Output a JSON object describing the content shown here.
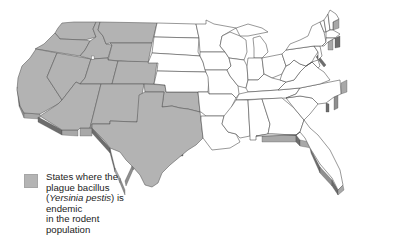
{
  "map": {
    "title": "Plague-endemic states (continental US)",
    "colors": {
      "endemic": "#b3b3b3",
      "non_endemic": "#ffffff",
      "border": "#444444",
      "edge_shadow": "#6d6d6d"
    },
    "endemic_states": [
      "Washington",
      "Oregon",
      "California",
      "Nevada",
      "Idaho",
      "Montana",
      "Wyoming",
      "Utah",
      "Colorado",
      "Arizona",
      "New Mexico",
      "Texas",
      "Oklahoma"
    ],
    "marker": "small white square in northern Utah"
  },
  "legend": {
    "swatch_color": "#b4b4b4",
    "line1": "States where the",
    "line2": "plague bacillus",
    "line3_open": "(",
    "line3_italic": "Yersinia pestis",
    "line3_close": ") is",
    "line4": "endemic",
    "line5": "in the rodent",
    "line6": "population"
  }
}
